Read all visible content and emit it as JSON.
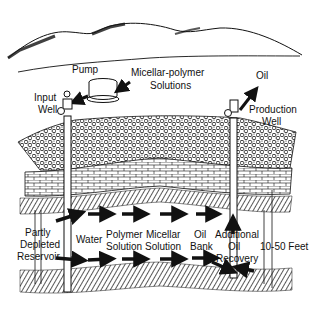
{
  "diagram": {
    "labels": {
      "pump": "Pump",
      "micellar_polymer_line1": "Micellar-polymer",
      "micellar_polymer_line2": "Solutions",
      "input_well_line1": "Input",
      "input_well_line2": "Well",
      "oil_top": "Oil",
      "production_well_line1": "Production",
      "production_well_line2": "Well",
      "partly_depleted_line1": "Partly",
      "partly_depleted_line2": "Depleted",
      "partly_depleted_line3": "Reservoir",
      "water": "Water",
      "polymer_line1": "Polymer",
      "polymer_line2": "Solution",
      "micellar_line1": "Micellar",
      "micellar_line2": "Solution",
      "oil_bank_line1": "Oil",
      "oil_bank_line2": "Bank",
      "additional_line1": "Additional",
      "additional_line2": "Oil",
      "additional_line3": "Recovery",
      "thickness": "10-50 Feet"
    },
    "colors": {
      "ink": "#111111",
      "background": "#ffffff"
    }
  }
}
